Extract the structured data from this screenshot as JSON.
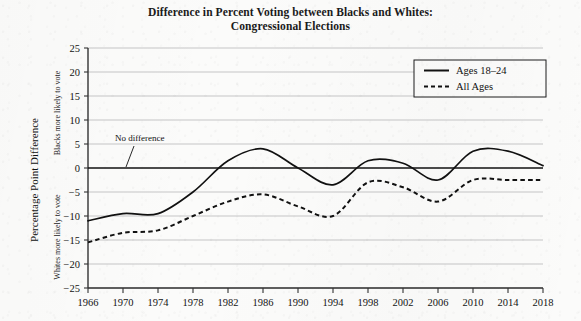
{
  "title": {
    "line1": "Difference in Percent Voting between Blacks and Whites:",
    "line2": "Congressional Elections"
  },
  "axes": {
    "y_title": "Percentage Point Difference",
    "y_caption_upper": "Blacks more likely to vote",
    "y_caption_lower": "Whites more likely to vote",
    "y_ticks": [
      "25",
      "20",
      "15",
      "10",
      "5",
      "0",
      "-5",
      "-10",
      "-15",
      "-20",
      "-25"
    ],
    "x_ticks": [
      "1966",
      "1970",
      "1974",
      "1978",
      "1982",
      "1986",
      "1990",
      "1994",
      "1998",
      "2002",
      "2006",
      "2010",
      "2014",
      "2018"
    ]
  },
  "annotation": {
    "no_difference": "No difference"
  },
  "legend": {
    "items": [
      {
        "label": "Ages 18–24",
        "style": "solid"
      },
      {
        "label": "All Ages",
        "style": "dashed"
      }
    ]
  },
  "colors": {
    "line": "#111111",
    "grid": "#b9b9b9",
    "axis": "#333333",
    "background": "#fbfbfa"
  },
  "chart_data": {
    "type": "line",
    "title": "Difference in Percent Voting between Blacks and Whites: Congressional Elections",
    "xlabel": "",
    "ylabel": "Percentage Point Difference",
    "xlim": [
      1966,
      2018
    ],
    "ylim": [
      -25,
      25
    ],
    "ytick_step": 5,
    "xtick_step": 4,
    "grid": true,
    "legend_position": "top-right",
    "zero_reference_line": 0,
    "annotations": [
      {
        "text": "No difference",
        "x": 1972,
        "y": 7,
        "points_to": {
          "x": 1974,
          "y": 0
        }
      }
    ],
    "x": [
      1966,
      1970,
      1974,
      1978,
      1982,
      1986,
      1990,
      1994,
      1998,
      2002,
      2006,
      2010,
      2014,
      2018
    ],
    "series": [
      {
        "name": "Ages 18–24",
        "style": "solid",
        "values": [
          -11.0,
          -9.5,
          -9.5,
          -5.0,
          1.5,
          4.0,
          0.0,
          -3.5,
          1.5,
          1.0,
          -2.5,
          3.5,
          3.5,
          0.5
        ]
      },
      {
        "name": "All Ages",
        "style": "dashed",
        "values": [
          -15.5,
          -13.5,
          -13.0,
          -10.0,
          -7.0,
          -5.5,
          -8.0,
          -10.0,
          -3.0,
          -4.0,
          -7.0,
          -2.5,
          -2.5,
          -2.5
        ]
      }
    ]
  }
}
